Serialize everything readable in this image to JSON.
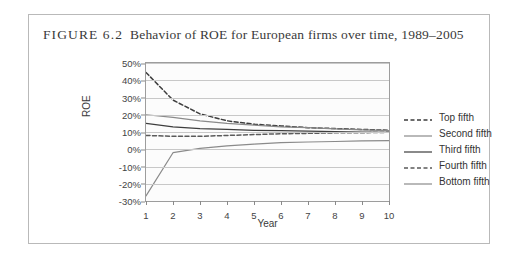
{
  "figure": {
    "label": "FIGURE 6.2",
    "caption": "Behavior of ROE for European firms over time, 1989–2005"
  },
  "chart_data": {
    "type": "line",
    "title": "Behavior of ROE for European firms over time, 1989–2005",
    "xlabel": "Year",
    "ylabel": "ROE",
    "x": [
      1,
      2,
      3,
      4,
      5,
      6,
      7,
      8,
      9,
      10
    ],
    "xlim": [
      1,
      10
    ],
    "ylim": [
      -0.3,
      0.5
    ],
    "ytick_labels": [
      "50%",
      "40%",
      "30%",
      "20%",
      "10%",
      "0%",
      "-10%",
      "-20%",
      "-30%"
    ],
    "ytick_values": [
      0.5,
      0.4,
      0.3,
      0.2,
      0.1,
      0.0,
      -0.1,
      -0.2,
      -0.3
    ],
    "xtick_labels": [
      "1",
      "2",
      "3",
      "4",
      "5",
      "6",
      "7",
      "8",
      "9",
      "10"
    ],
    "grid": "horizontal",
    "legend_position": "right",
    "series": [
      {
        "name": "Top fifth",
        "style": "dashed",
        "color": "#3d3d3d",
        "values": [
          0.445,
          0.285,
          0.205,
          0.165,
          0.145,
          0.135,
          0.125,
          0.12,
          0.115,
          0.11
        ]
      },
      {
        "name": "Second fifth",
        "style": "solid",
        "color": "#8a8a8a",
        "values": [
          0.2,
          0.185,
          0.165,
          0.15,
          0.14,
          0.13,
          0.125,
          0.118,
          0.112,
          0.108
        ]
      },
      {
        "name": "Third fifth",
        "style": "solid",
        "color": "#3d3d3d",
        "values": [
          0.15,
          0.13,
          0.12,
          0.115,
          0.11,
          0.108,
          0.105,
          0.102,
          0.1,
          0.098
        ]
      },
      {
        "name": "Fourth fifth",
        "style": "dashed",
        "color": "#5a5a5a",
        "values": [
          0.08,
          0.075,
          0.075,
          0.08,
          0.085,
          0.09,
          0.092,
          0.095,
          0.096,
          0.098
        ]
      },
      {
        "name": "Bottom fifth",
        "style": "solid",
        "color": "#8a8a8a",
        "values": [
          -0.27,
          -0.02,
          0.005,
          0.02,
          0.03,
          0.038,
          0.042,
          0.045,
          0.048,
          0.05
        ]
      }
    ]
  },
  "legend": {
    "items": [
      {
        "label": "Top fifth"
      },
      {
        "label": "Second fifth"
      },
      {
        "label": "Third fifth"
      },
      {
        "label": "Fourth fifth"
      },
      {
        "label": "Bottom fifth"
      }
    ]
  }
}
